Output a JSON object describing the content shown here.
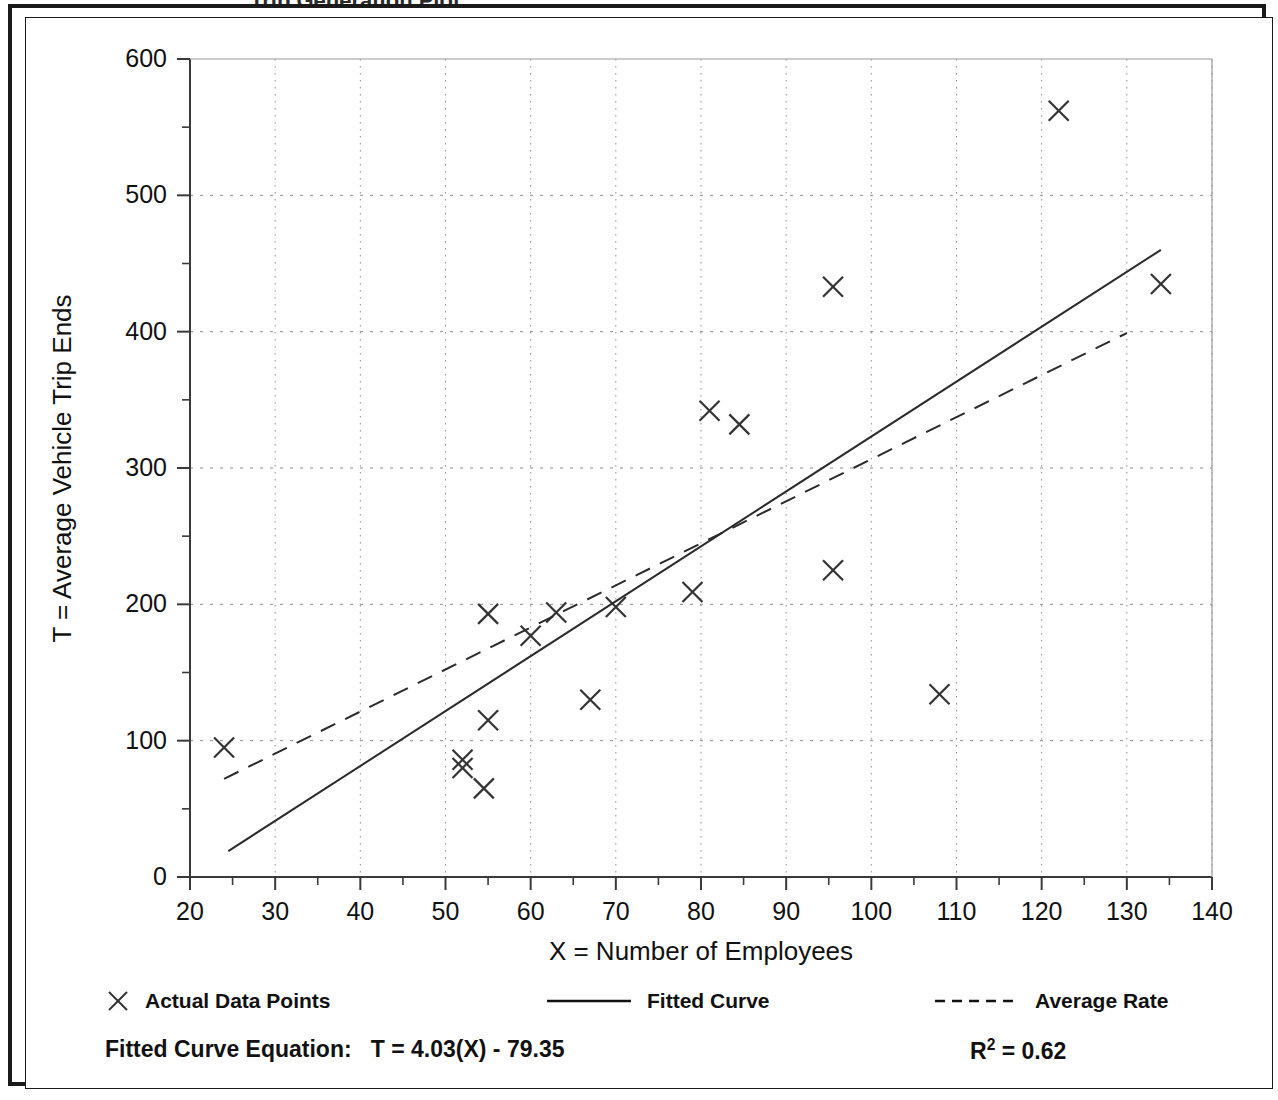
{
  "figure": {
    "frame_border_color": "#1a1a1a",
    "background": "#ffffff",
    "title_remnant": "Trip Generation Plot"
  },
  "axis": {
    "y_label": "T = Average Vehicle Trip Ends",
    "x_label": "X = Number of Employees",
    "y_ticks": [
      "0",
      "100",
      "200",
      "300",
      "400",
      "500",
      "600"
    ],
    "x_ticks": [
      "20",
      "30",
      "40",
      "50",
      "60",
      "70",
      "80",
      "90",
      "100",
      "110",
      "120",
      "130",
      "140"
    ]
  },
  "legend": {
    "items": [
      {
        "label": "Actual Data Points",
        "marker": "x-marker-icon",
        "style": "marker"
      },
      {
        "label": "Fitted Curve",
        "marker": "solid-line-icon",
        "style": "solid"
      },
      {
        "label": "Average Rate",
        "marker": "dashed-line-icon",
        "style": "dashed"
      }
    ]
  },
  "footer": {
    "equation_label": "Fitted Curve Equation:",
    "equation": "T = 4.03(X) - 79.35",
    "r_squared_label": "R",
    "r_squared_exponent": "2",
    "r_squared_value": "= 0.62"
  },
  "chart_data": {
    "type": "scatter",
    "title": "",
    "xlabel": "X = Number of Employees",
    "ylabel": "T = Average Vehicle Trip Ends",
    "xlim": [
      20,
      140
    ],
    "ylim": [
      0,
      600
    ],
    "xticks": [
      20,
      30,
      40,
      50,
      60,
      70,
      80,
      90,
      100,
      110,
      120,
      130,
      140
    ],
    "yticks": [
      0,
      100,
      200,
      300,
      400,
      500,
      600
    ],
    "x_minor_step": 5,
    "y_minor_step": 50,
    "grid": true,
    "grid_style": "dotted",
    "legend_position": "below-axes",
    "marker_symbol": "x",
    "marker_color": "#333333",
    "series": [
      {
        "name": "Actual Data Points",
        "type": "scatter",
        "points": [
          {
            "x": 24,
            "y": 95
          },
          {
            "x": 52,
            "y": 86
          },
          {
            "x": 52,
            "y": 80
          },
          {
            "x": 54.5,
            "y": 65
          },
          {
            "x": 55,
            "y": 115
          },
          {
            "x": 55,
            "y": 193
          },
          {
            "x": 60,
            "y": 177
          },
          {
            "x": 63,
            "y": 194
          },
          {
            "x": 67,
            "y": 130
          },
          {
            "x": 70,
            "y": 198
          },
          {
            "x": 79,
            "y": 209
          },
          {
            "x": 81,
            "y": 342
          },
          {
            "x": 84.5,
            "y": 332
          },
          {
            "x": 95.5,
            "y": 225
          },
          {
            "x": 95.5,
            "y": 433
          },
          {
            "x": 108,
            "y": 134
          },
          {
            "x": 122,
            "y": 562
          },
          {
            "x": 134,
            "y": 435
          }
        ]
      },
      {
        "name": "Fitted Curve",
        "type": "line",
        "style": "solid",
        "equation": "T = 4.03(X) - 79.35",
        "slope": 4.03,
        "intercept": -79.35,
        "x_start": 24.5,
        "x_end": 134,
        "y_start": 19,
        "y_end": 460
      },
      {
        "name": "Average Rate",
        "type": "line",
        "style": "dashed",
        "x_start": 24,
        "x_end": 130,
        "y_start": 72,
        "y_end": 399
      }
    ]
  }
}
